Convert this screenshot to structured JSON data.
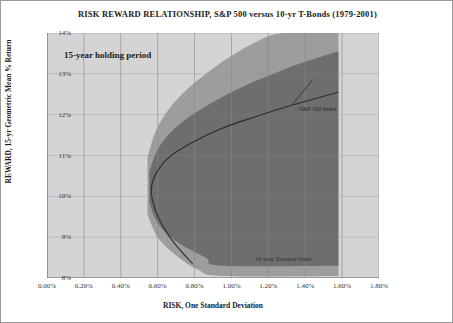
{
  "chart_title": "RISK REWARD RELATIONSHIP,  S&P 500 versus 10-yr T-Bonds (1979-2001)",
  "callout": "15-year holding period",
  "axes": {
    "xlabel": "RISK, One Standard Deviation",
    "ylabel": "REWARD, 15-yr Geometric Mean % Return",
    "xticks": [
      "0.00%",
      "0.20%",
      "0.40%",
      "0.60%",
      "0.80%",
      "1.00%",
      "1.20%",
      "1.40%",
      "1.60%",
      "1.80%"
    ],
    "yticks": [
      "14%",
      "13%",
      "12%",
      "11%",
      "10%",
      "9%",
      "8%"
    ]
  },
  "annotations": {
    "spx": "S&P 500 Index",
    "tbond": "10-year Treasury bond"
  },
  "colors": {
    "plot_background": "#d4d4d4",
    "outer_band": "#9d9d9d",
    "inner_band": "#6e6e6e",
    "median_line": "#2a2a2a",
    "gridline": "#8a8a8a",
    "axis": "#6b6b6b",
    "text": "#1a1a1a"
  },
  "chart_data": {
    "type": "area",
    "title": "RISK REWARD RELATIONSHIP,  S&P 500 versus 10-yr T-Bonds (1979-2001)",
    "xlabel": "RISK, One Standard Deviation",
    "ylabel": "REWARD, 15-yr Geometric Mean % Return",
    "xlim": [
      0.0,
      1.8
    ],
    "ylim": [
      8,
      14
    ],
    "x_unit": "percent",
    "y_unit": "percent",
    "grid": true,
    "legend": "annotated-inline",
    "note": "Efficient-frontier style envelope: a backward-bending nose at about 0.57% risk / 10.2% return opening rightward to 1.60% risk. Two nested confidence bands around a median curve.",
    "series": [
      {
        "name": "Median (expected) frontier",
        "style": "line",
        "color": "#2a2a2a",
        "points": [
          {
            "x": 0.79,
            "y": 8.35
          },
          {
            "x": 0.7,
            "y": 8.8
          },
          {
            "x": 0.63,
            "y": 9.25
          },
          {
            "x": 0.585,
            "y": 9.7
          },
          {
            "x": 0.565,
            "y": 10.15
          },
          {
            "x": 0.59,
            "y": 10.55
          },
          {
            "x": 0.66,
            "y": 10.95
          },
          {
            "x": 0.78,
            "y": 11.3
          },
          {
            "x": 0.94,
            "y": 11.65
          },
          {
            "x": 1.13,
            "y": 11.95
          },
          {
            "x": 1.34,
            "y": 12.25
          },
          {
            "x": 1.58,
            "y": 12.55
          }
        ]
      },
      {
        "name": "Inner band upper bound",
        "style": "band-edge",
        "color": "#6e6e6e",
        "points": [
          {
            "x": 0.555,
            "y": 10.6
          },
          {
            "x": 0.6,
            "y": 11.15
          },
          {
            "x": 0.7,
            "y": 11.7
          },
          {
            "x": 0.86,
            "y": 12.2
          },
          {
            "x": 1.07,
            "y": 12.7
          },
          {
            "x": 1.31,
            "y": 13.15
          },
          {
            "x": 1.58,
            "y": 13.55
          }
        ]
      },
      {
        "name": "Inner band lower bound",
        "style": "band-edge",
        "color": "#6e6e6e",
        "points": [
          {
            "x": 0.555,
            "y": 9.85
          },
          {
            "x": 0.6,
            "y": 9.35
          },
          {
            "x": 0.7,
            "y": 8.9
          },
          {
            "x": 0.86,
            "y": 8.5
          },
          {
            "x": 0.95,
            "y": 8.3
          },
          {
            "x": 1.58,
            "y": 8.3
          }
        ]
      },
      {
        "name": "Outer band upper bound",
        "style": "band-edge",
        "color": "#9d9d9d",
        "points": [
          {
            "x": 0.545,
            "y": 10.95
          },
          {
            "x": 0.6,
            "y": 11.7
          },
          {
            "x": 0.72,
            "y": 12.45
          },
          {
            "x": 0.92,
            "y": 13.2
          },
          {
            "x": 1.12,
            "y": 13.75
          },
          {
            "x": 1.28,
            "y": 14.0
          },
          {
            "x": 1.58,
            "y": 14.0
          }
        ]
      },
      {
        "name": "Outer band lower bound",
        "style": "band-edge",
        "color": "#9d9d9d",
        "points": [
          {
            "x": 0.545,
            "y": 9.55
          },
          {
            "x": 0.6,
            "y": 9.0
          },
          {
            "x": 0.7,
            "y": 8.55
          },
          {
            "x": 0.82,
            "y": 8.2
          },
          {
            "x": 0.95,
            "y": 8.05
          },
          {
            "x": 1.58,
            "y": 8.05
          }
        ]
      }
    ],
    "annotations": [
      {
        "text": "S&P 500 Index",
        "x": 1.44,
        "y": 12.95
      },
      {
        "text": "10-year Treasury bond",
        "x": 1.12,
        "y": 8.55
      },
      {
        "text": "15-year holding period",
        "x": 0.14,
        "y": 13.55
      }
    ]
  }
}
